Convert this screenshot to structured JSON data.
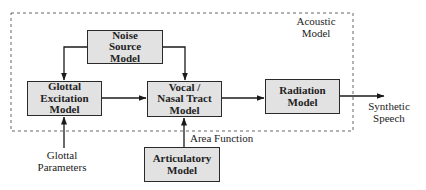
{
  "diagram": {
    "boundary_label": "Acoustic\nModel",
    "blocks": [
      {
        "id": "noise",
        "label": "Noise\nSource\nModel"
      },
      {
        "id": "glottal",
        "label": "Glottal\nExcitation\nModel"
      },
      {
        "id": "vocal",
        "label": "Vocal /\nNasal Tract\nModel"
      },
      {
        "id": "radiation",
        "label": "Radiation\nModel"
      },
      {
        "id": "articulatory",
        "label": "Articulatory\nModel"
      }
    ],
    "external_labels": {
      "output": "Synthetic\nSpeech",
      "glottal_input": "Glottal\nParameters",
      "area_function": "Area Function"
    },
    "edges": [
      {
        "from": "noise",
        "to": "glottal"
      },
      {
        "from": "noise",
        "to": "vocal"
      },
      {
        "from": "glottal",
        "to": "vocal"
      },
      {
        "from": "vocal",
        "to": "radiation"
      },
      {
        "from": "radiation",
        "to": "output",
        "label": "Synthetic Speech"
      },
      {
        "from": "glottal_input",
        "to": "glottal",
        "label": "Glottal Parameters"
      },
      {
        "from": "articulatory",
        "to": "vocal",
        "label": "Area Function"
      }
    ],
    "colors": {
      "block_fill": "#e2e2e2",
      "stroke": "#2a2a2a",
      "background": "#ffffff"
    }
  }
}
